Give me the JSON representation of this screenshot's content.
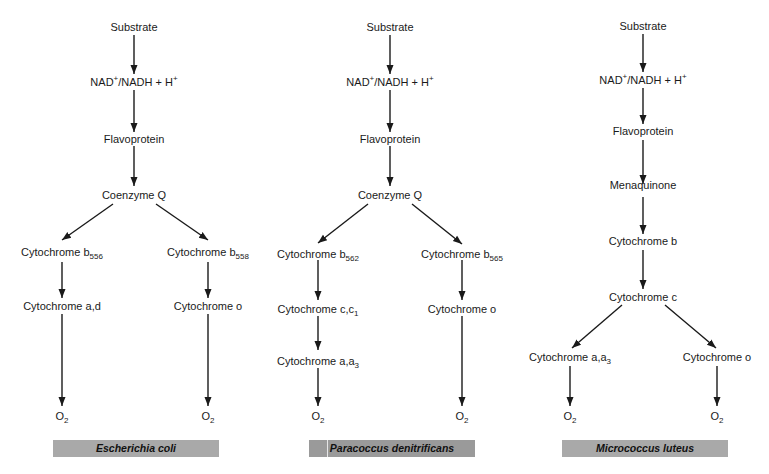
{
  "diagram": {
    "type": "electron-transport-chains",
    "panels": [
      {
        "organism": "Escherichia coli",
        "nodes": {
          "substrate": "Substrate",
          "nad": "NAD+/NADH + H+",
          "flavo": "Flavoprotein",
          "coq": "Coenzyme Q",
          "b_left": "Cytochrome b556",
          "b_right": "Cytochrome b558",
          "left_2": "Cytochrome a,d",
          "right_2": "Cytochrome o",
          "o2_left": "O2",
          "o2_right": "O2"
        }
      },
      {
        "organism": "Paracoccus denitrificans",
        "nodes": {
          "substrate": "Substrate",
          "nad": "NAD+/NADH + H+",
          "flavo": "Flavoprotein",
          "coq": "Coenzyme Q",
          "b_left": "Cytochrome b562",
          "b_right": "Cytochrome b565",
          "left_2": "Cytochrome c,c1",
          "left_3": "Cytochrome a,a3",
          "right_2": "Cytochrome o",
          "o2_left": "O2",
          "o2_right": "O2"
        }
      },
      {
        "organism": "Micrococcus luteus",
        "nodes": {
          "substrate": "Substrate",
          "nad": "NAD+/NADH + H+",
          "flavo": "Flavoprotein",
          "mena": "Menaquinone",
          "cytb": "Cytochrome b",
          "cytc": "Cytochrome c",
          "left": "Cytochrome a,a3",
          "right": "Cytochrome o",
          "o2_left": "O2",
          "o2_right": "O2"
        }
      }
    ],
    "colors": {
      "label_bar": "#a9a9a9",
      "line": "#1a1a1a"
    }
  }
}
